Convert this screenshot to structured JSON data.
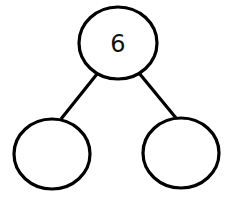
{
  "diagram": {
    "type": "number-bond",
    "whole": {
      "value": "6",
      "cx": 118,
      "cy": 43,
      "rx": 39,
      "ry": 36
    },
    "parts": [
      {
        "value": "",
        "cx": 52,
        "cy": 154,
        "rx": 38,
        "ry": 35
      },
      {
        "value": "",
        "cx": 181,
        "cy": 153,
        "rx": 38,
        "ry": 35
      }
    ],
    "edges": [
      {
        "x1": 97,
        "y1": 74,
        "x2": 61,
        "y2": 119
      },
      {
        "x1": 139,
        "y1": 73,
        "x2": 176,
        "y2": 118
      }
    ],
    "colors": {
      "stroke": "#000000",
      "fill": "#ffffff",
      "background": "#ffffff"
    }
  }
}
